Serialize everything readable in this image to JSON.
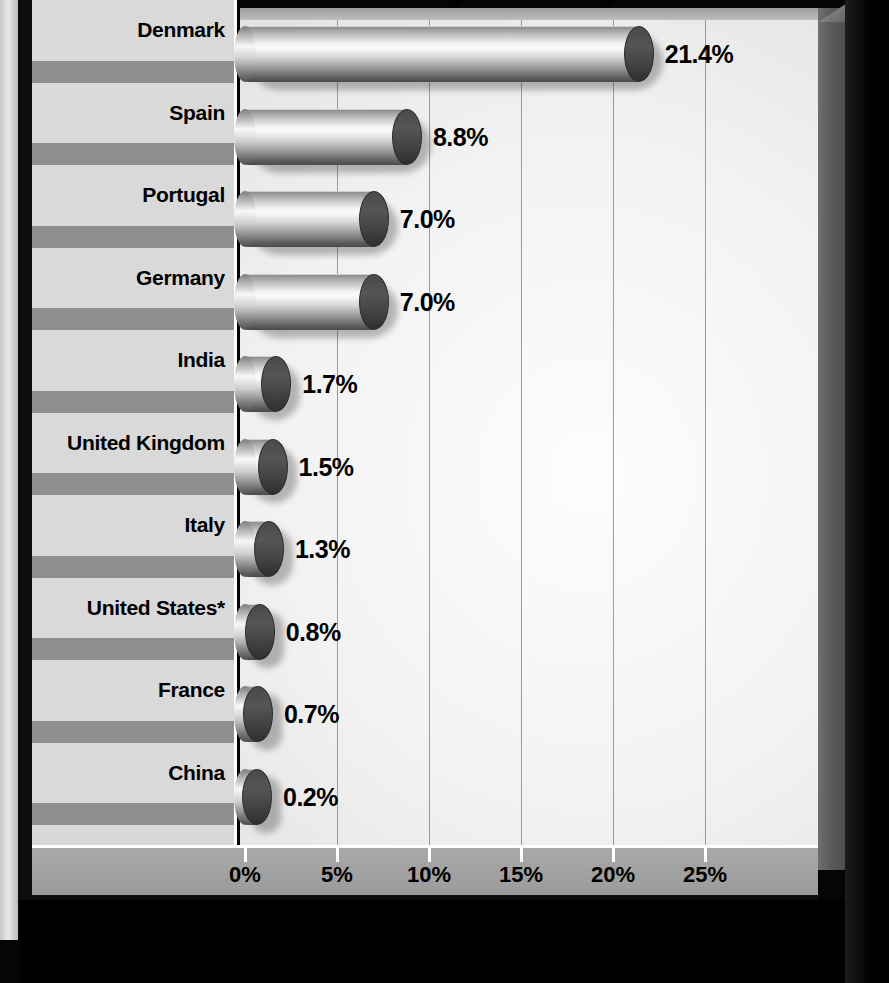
{
  "chart": {
    "title": "Consumption for the year 2000",
    "axis_title": "Percentage",
    "footnote_marker": "*"
  },
  "chart_data": {
    "type": "bar",
    "orientation": "horizontal",
    "title": "Consumption for the year 2000",
    "xlabel": "Percentage",
    "ylabel": "",
    "xlim": [
      0,
      27.5
    ],
    "grid": true,
    "legend": "none",
    "categories": [
      "Denmark",
      "Spain",
      "Portugal",
      "Germany",
      "India",
      "United Kingdom",
      "Italy",
      "United States*",
      "France",
      "China"
    ],
    "values": [
      21.4,
      8.8,
      7.0,
      7.0,
      1.7,
      1.5,
      1.3,
      0.8,
      0.7,
      0.2
    ],
    "value_labels": [
      "21.4%",
      "8.8%",
      "7.0%",
      "7.0%",
      "1.7%",
      "1.5%",
      "1.3%",
      "0.8%",
      "0.7%",
      "0.2%"
    ],
    "xticks": [
      0,
      5,
      10,
      15,
      20,
      25
    ],
    "xticklabels": [
      "0%",
      "5%",
      "10%",
      "15%",
      "20%",
      "25%"
    ]
  },
  "colors": {
    "bar_light": "#fbfbfb",
    "bar_dark": "#4a4a4a",
    "cap_dark": "#3f3f3f",
    "panel_light": "#d9d9d9",
    "panel_band": "#8f8f8f",
    "axis_band": "#a9a9a9",
    "axis_title_band": "#0d0d0d",
    "axis_title_text": "#ffffff",
    "frame_black": "#050505",
    "gridline": "#7d7d7d"
  }
}
